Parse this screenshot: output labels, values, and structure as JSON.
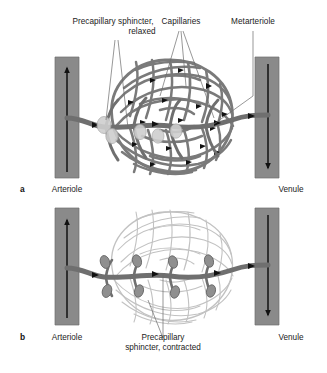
{
  "figure": {
    "background": "#ffffff",
    "width": 327,
    "height": 373
  },
  "colors": {
    "vessel_dark": "#6f6f6f",
    "vessel_bar": "#8a8a8a",
    "vessel_bar_edge": "#6e6e6e",
    "capillary_open": "#7a7a7a",
    "capillary_closed": "#c2c2c2",
    "sphincter_relaxed_fill": "#cfcfcf",
    "sphincter_contracted_fill": "#8f8f8f",
    "arrow": "#111111",
    "leader_line": "#6b6b6b",
    "text": "#1a1a1a"
  },
  "panels": [
    {
      "id": "a",
      "letter": "a",
      "state": "sphincters relaxed — capillaries perfused",
      "labels": {
        "sphincter": "Precapillary sphincter,\nrelaxed",
        "capillaries": "Capillaries",
        "metarteriole": "Metarteriole",
        "arteriole": "Arteriole",
        "venule": "Venule"
      },
      "flow": {
        "arteriole_direction": "up",
        "venule_direction": "down"
      }
    },
    {
      "id": "b",
      "letter": "b",
      "state": "sphincters contracted — capillaries bypassed",
      "labels": {
        "sphincter": "Precapillary\nsphincter, contracted",
        "arteriole": "Arteriole",
        "venule": "Venule"
      },
      "flow": {
        "arteriole_direction": "up",
        "venule_direction": "down"
      }
    }
  ]
}
